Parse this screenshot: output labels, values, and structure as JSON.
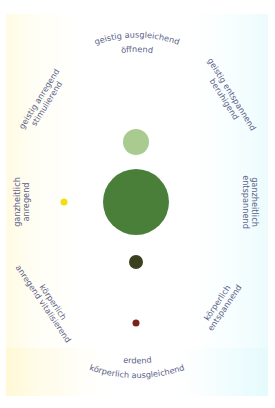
{
  "diagram": {
    "labels": {
      "top_line1": "geistig ausgleichend",
      "top_line2": "öffnend",
      "upper_right_line1": "geistig entspannend",
      "upper_right_line2": "beruhigend",
      "right_line1": "ganzheitlich",
      "right_line2": "entspannend",
      "lower_right_line1": "körperlich",
      "lower_right_line2": "entspannend",
      "bottom_line1": "erdend",
      "bottom_line2": "körperlich ausgleichend",
      "lower_left_line1": "körperlich",
      "lower_left_line2": "anregend vitalisierend",
      "left_line1": "ganzheitlich",
      "left_line2": "anregend",
      "upper_left_line1": "geistig anregend",
      "upper_left_line2": "stimulierend"
    },
    "circles": [
      {
        "name": "light-green-circle",
        "cx": 136,
        "cy": 142,
        "r": 13,
        "color": "#a9cb8f"
      },
      {
        "name": "large-green-circle",
        "cx": 136,
        "cy": 202,
        "r": 33,
        "color": "#4a7f3a"
      },
      {
        "name": "dark-olive-circle",
        "cx": 136,
        "cy": 262,
        "r": 7,
        "color": "#3a4020"
      },
      {
        "name": "brown-dot",
        "cx": 136,
        "cy": 323,
        "r": 3.5,
        "color": "#7a2419"
      },
      {
        "name": "yellow-dot",
        "cx": 64,
        "cy": 202,
        "r": 3.5,
        "color": "#f0e010"
      }
    ],
    "text_color": "#5b6088"
  }
}
